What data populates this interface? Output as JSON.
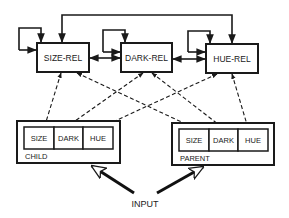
{
  "diagram": {
    "relation_nodes": [
      {
        "id": "size-rel",
        "label": "SIZE-REL"
      },
      {
        "id": "dark-rel",
        "label": "DARK-REL"
      },
      {
        "id": "hue-rel",
        "label": "HUE-REL"
      }
    ],
    "object_nodes": [
      {
        "id": "child",
        "label": "CHILD",
        "features": [
          "SIZE",
          "DARK",
          "HUE"
        ]
      },
      {
        "id": "parent",
        "label": "PARENT",
        "features": [
          "SIZE",
          "DARK",
          "HUE"
        ]
      }
    ],
    "input_label": "INPUT",
    "edges": [
      {
        "from": "size-rel",
        "to": "size-rel",
        "style": "solid",
        "type": "self-loop"
      },
      {
        "from": "dark-rel",
        "to": "dark-rel",
        "style": "solid",
        "type": "self-loop"
      },
      {
        "from": "hue-rel",
        "to": "hue-rel",
        "style": "solid",
        "type": "self-loop"
      },
      {
        "from": "size-rel",
        "to": "dark-rel",
        "style": "solid",
        "type": "bidirectional"
      },
      {
        "from": "dark-rel",
        "to": "hue-rel",
        "style": "solid",
        "type": "bidirectional"
      },
      {
        "from": "size-rel",
        "to": "hue-rel",
        "style": "solid",
        "type": "bidirectional",
        "route": "over-top"
      },
      {
        "from": "size-rel",
        "to": "child.SIZE",
        "style": "dashed",
        "type": "bidirectional"
      },
      {
        "from": "size-rel",
        "to": "parent.SIZE",
        "style": "dashed",
        "type": "bidirectional"
      },
      {
        "from": "dark-rel",
        "to": "child.DARK",
        "style": "dashed",
        "type": "bidirectional"
      },
      {
        "from": "dark-rel",
        "to": "parent.DARK",
        "style": "dashed",
        "type": "bidirectional"
      },
      {
        "from": "hue-rel",
        "to": "child.HUE",
        "style": "dashed",
        "type": "bidirectional"
      },
      {
        "from": "hue-rel",
        "to": "parent.HUE",
        "style": "dashed",
        "type": "bidirectional"
      },
      {
        "from": "input",
        "to": "child",
        "style": "thick"
      },
      {
        "from": "input",
        "to": "parent",
        "style": "thick"
      }
    ],
    "colors": {
      "stroke": "#1a1a1a",
      "background": "#ffffff"
    }
  }
}
